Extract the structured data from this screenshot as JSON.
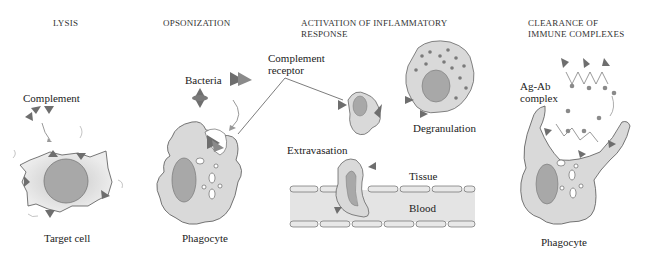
{
  "panels": [
    {
      "title": "LYSIS",
      "labels": {
        "agent": "Complement",
        "cell": "Target cell"
      }
    },
    {
      "title": "OPSONIZATION",
      "labels": {
        "agent": "Bacteria",
        "cell": "Phagocyte"
      }
    },
    {
      "title_line1": "ACTIVATION OF INFLAMMATORY",
      "title_line2": "RESPONSE",
      "labels": {
        "receptor_line1": "Complement",
        "receptor_line2": "receptor",
        "degranulation": "Degranulation",
        "extravasation": "Extravasation",
        "tissue": "Tissue",
        "blood": "Blood"
      }
    },
    {
      "title_line1": "CLEARANCE OF",
      "title_line2": "IMMUNE COMPLEXES",
      "labels": {
        "complex_line1": "Ag-Ab",
        "complex_line2": "complex",
        "cell": "Phagocyte"
      }
    }
  ],
  "colors": {
    "cell_fill": "#d9d9d9",
    "nucleus_fill": "#a8a8a8",
    "complement_fill": "#6e6e6e",
    "outline": "#555555",
    "vessel_fill": "#e4e4e4"
  }
}
